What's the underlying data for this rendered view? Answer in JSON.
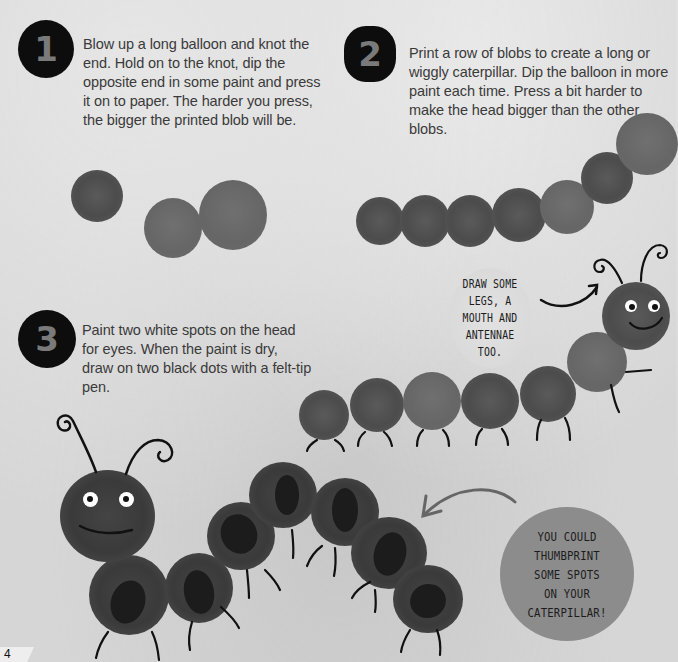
{
  "steps": [
    {
      "number": "1",
      "text": "Blow up a long balloon and knot the end. Hold on to the knot, dip the opposite end in some paint and press it on to paper. The harder you press, the bigger the printed blob will be."
    },
    {
      "number": "2",
      "text": "Print a row of blobs to create a long or wiggly caterpillar. Dip the balloon in more paint each time. Press a bit harder to make the head bigger than the other blobs."
    },
    {
      "number": "3",
      "text": "Paint two white spots on the head for eyes. When the paint is dry, draw on two black dots with a felt-tip pen."
    }
  ],
  "callouts": {
    "draw_tip": "DRAW SOME LEGS, A MOUTH AND ANTENNAE TOO.",
    "thumbprint_tip": "YOU COULD THUMBPRINT SOME SPOTS ON YOUR CATERPILLAR!"
  },
  "page_number": "4",
  "colors": {
    "background": "#d6d6d6",
    "badge": "#0d0d0d",
    "badge_numeral": "#7a7a7a",
    "paint": "#555555",
    "text": "#3a3a3a",
    "callout_light": "#dddddd",
    "callout_dark": "#8c8c8c"
  }
}
